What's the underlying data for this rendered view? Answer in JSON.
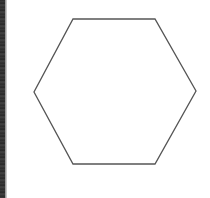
{
  "diagram": {
    "shape": "hexagon",
    "stroke_color": "#555555",
    "fill_color": "#ffffff",
    "stroke_width": 1.3,
    "points": "73,19 155,19 196,91 155,164 73,164 34,92"
  },
  "edge_strip": {
    "color": "#2e2e2e"
  }
}
